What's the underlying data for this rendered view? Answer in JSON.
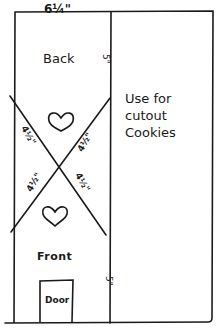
{
  "diagram": {
    "type": "hand-drawn template sketch",
    "ink_color": "#1a1a1a",
    "background": "#ffffff",
    "labels": {
      "width": "6¼\"",
      "back": "Back",
      "front": "Front",
      "door": "Door",
      "side_top": "5\"",
      "side_bottom": "5\"",
      "diagonal_top_left": "4½\"",
      "diagonal_top_right": "4½\"",
      "diagonal_bottom_left": "4½\"",
      "diagonal_bottom_right": "4½\"",
      "note_line1": "Use for",
      "note_line2": "cutout",
      "note_line3": "Cookies"
    },
    "icons": {
      "top_heart": "heart-icon",
      "bottom_heart": "heart-icon"
    }
  }
}
